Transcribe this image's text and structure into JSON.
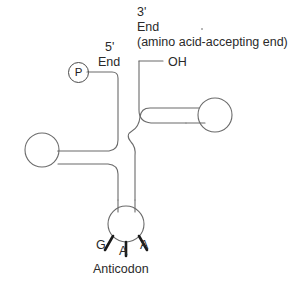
{
  "diagram": {
    "title_absent": "",
    "structure_name": "tRNA cloverleaf",
    "stroke_color": "#6b6b6b",
    "tick_color": "#1a1a1a",
    "background_color": "#ffffff",
    "labels": {
      "three_prime": "3'",
      "three_prime_end": "End",
      "accepting_end": "(amino acid-accepting end)",
      "five_prime": "5'",
      "five_prime_end": "End",
      "hydroxyl": "OH",
      "phosphate": "P",
      "anticodon_base_1": "G",
      "anticodon_base_2": "A",
      "anticodon_base_3": "A",
      "anticodon_caption": "Anticodon"
    }
  }
}
